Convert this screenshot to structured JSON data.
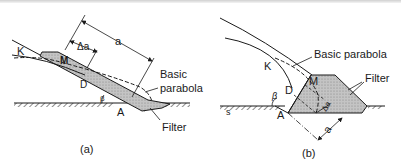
{
  "figure": {
    "panels": [
      {
        "id": "a",
        "caption": "(a)",
        "labels": {
          "K": "K",
          "M": "M",
          "D": "D",
          "A": "A",
          "beta": "β",
          "delta_a": "Δa",
          "a": "a",
          "basic_parabola_line1": "Basic",
          "basic_parabola_line2": "parabola",
          "filter": "Filter"
        }
      },
      {
        "id": "b",
        "caption": "(b)",
        "labels": {
          "K": "K",
          "M": "M",
          "D": "D",
          "A": "A",
          "beta": "β",
          "delta_a": "Δa",
          "a": "a",
          "s": "s",
          "basic_parabola": "Basic parabola",
          "filter": "Filter"
        }
      }
    ],
    "colors": {
      "line": "#1a1a1a",
      "filter_fill": "#bdbdbd",
      "background": "#ffffff"
    }
  }
}
